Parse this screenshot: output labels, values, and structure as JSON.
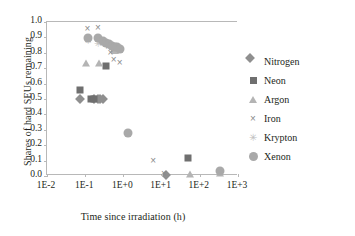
{
  "chart_data": {
    "type": "scatter",
    "title": "",
    "xlabel": "Time since irradiation (h)",
    "ylabel": "Shares of hard SEUs remaining",
    "xscale": "log",
    "xlim": [
      0.01,
      1000
    ],
    "ylim": [
      0.0,
      1.0
    ],
    "grid": false,
    "legend_position": "right",
    "xticks": [
      "1E-2",
      "1E-1",
      "1E+0",
      "1E+1",
      "1E+2",
      "1E+3"
    ],
    "xtick_values": [
      0.01,
      0.1,
      1,
      10,
      100,
      1000
    ],
    "yticks": [
      "0.0",
      "0.1",
      "0.2",
      "0.3",
      "0.4",
      "0.5",
      "0.6",
      "0.7",
      "0.8",
      "0.9",
      "1.0"
    ],
    "ytick_values": [
      0.0,
      0.1,
      0.2,
      0.3,
      0.4,
      0.5,
      0.6,
      0.7,
      0.8,
      0.9,
      1.0
    ],
    "series": [
      {
        "name": "Nitrogen",
        "marker": "diamond",
        "color": "#8f8f8f",
        "points": [
          {
            "x": 0.075,
            "y": 0.5
          },
          {
            "x": 0.175,
            "y": 0.5
          },
          {
            "x": 0.21,
            "y": 0.5
          },
          {
            "x": 0.25,
            "y": 0.5
          },
          {
            "x": 0.3,
            "y": 0.5
          },
          {
            "x": 13.0,
            "y": 0.005
          }
        ]
      },
      {
        "name": "Neon",
        "marker": "square",
        "color": "#6f6f6f",
        "points": [
          {
            "x": 0.072,
            "y": 0.56
          },
          {
            "x": 0.145,
            "y": 0.5
          },
          {
            "x": 0.165,
            "y": 0.5
          },
          {
            "x": 0.36,
            "y": 0.715
          },
          {
            "x": 0.6,
            "y": 0.815
          },
          {
            "x": 50.0,
            "y": 0.115
          }
        ]
      },
      {
        "name": "Argon",
        "marker": "triangle",
        "color": "#b4b4b4",
        "points": [
          {
            "x": 0.105,
            "y": 0.735
          },
          {
            "x": 0.235,
            "y": 0.735
          },
          {
            "x": 0.62,
            "y": 0.815
          },
          {
            "x": 0.72,
            "y": 0.83
          },
          {
            "x": 55.0,
            "y": 0.015
          },
          {
            "x": 330.0,
            "y": 0.02
          }
        ]
      },
      {
        "name": "Iron",
        "marker": "cross",
        "color": "#8a8a8a",
        "points": [
          {
            "x": 0.115,
            "y": 0.955
          },
          {
            "x": 0.215,
            "y": 0.96
          },
          {
            "x": 0.33,
            "y": 0.87
          },
          {
            "x": 0.4,
            "y": 0.835
          },
          {
            "x": 0.46,
            "y": 0.8
          },
          {
            "x": 0.56,
            "y": 0.755
          },
          {
            "x": 0.8,
            "y": 0.735
          },
          {
            "x": 6.0,
            "y": 0.095
          },
          {
            "x": 11.5,
            "y": 0.015
          }
        ]
      },
      {
        "name": "Krypton",
        "marker": "star",
        "color": "#c0c0c0",
        "points": [
          {
            "x": 0.115,
            "y": 0.875
          },
          {
            "x": 0.22,
            "y": 0.86
          },
          {
            "x": 0.3,
            "y": 0.855
          },
          {
            "x": 0.42,
            "y": 0.845
          },
          {
            "x": 0.52,
            "y": 0.84
          },
          {
            "x": 0.66,
            "y": 0.83
          }
        ]
      },
      {
        "name": "Xenon",
        "marker": "circle",
        "color": "#a9a9a9",
        "points": [
          {
            "x": 0.118,
            "y": 0.895
          },
          {
            "x": 0.215,
            "y": 0.895
          },
          {
            "x": 0.29,
            "y": 0.875
          },
          {
            "x": 0.34,
            "y": 0.865
          },
          {
            "x": 0.42,
            "y": 0.855
          },
          {
            "x": 0.5,
            "y": 0.845
          },
          {
            "x": 0.6,
            "y": 0.835
          },
          {
            "x": 0.7,
            "y": 0.835
          },
          {
            "x": 0.82,
            "y": 0.825
          },
          {
            "x": 1.3,
            "y": 0.28
          },
          {
            "x": 330.0,
            "y": 0.035
          }
        ]
      }
    ]
  },
  "legend": {
    "items": [
      {
        "label": "Nitrogen",
        "marker": "diamond"
      },
      {
        "label": "Neon",
        "marker": "square"
      },
      {
        "label": "Argon",
        "marker": "triangle"
      },
      {
        "label": "Iron",
        "marker": "cross"
      },
      {
        "label": "Krypton",
        "marker": "star"
      },
      {
        "label": "Xenon",
        "marker": "circle"
      }
    ]
  }
}
